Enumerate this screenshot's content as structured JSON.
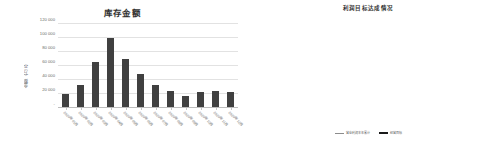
{
  "charts": [
    {
      "title": "库存金额",
      "ylabel": "金额（万元）"
    },
    {
      "title": "利润目标达成情况",
      "ylabel": "金额（元）"
    }
  ],
  "chart_data": [
    {
      "type": "bar",
      "title": "库存金额",
      "xlabel": "",
      "ylabel": "金额（万元）",
      "ylim": [
        0,
        120000
      ],
      "yticks": [
        0,
        20000,
        40000,
        60000,
        80000,
        100000,
        120000
      ],
      "ytick_labels": [
        "-",
        "20 000",
        "40 000",
        "60 000",
        "80 000",
        "100 000",
        "120 000"
      ],
      "grid": true,
      "legend": "none",
      "categories": [
        "2020年01月",
        "2020年02月",
        "2020年03月",
        "2020年04月",
        "2020年05月",
        "2020年06月",
        "2020年07月",
        "2020年08月",
        "2020年09月",
        "2020年10月",
        "2020年11月",
        "2020年12月"
      ],
      "values": [
        19000,
        31000,
        65000,
        98000,
        68000,
        47000,
        32000,
        23000,
        16000,
        21000,
        23000,
        22000
      ],
      "bar_color": "#404040"
    },
    {
      "type": "line",
      "title": "利润目标达成情况",
      "xlabel": "",
      "ylabel": "金额（元）",
      "ylim": [
        0,
        800000
      ],
      "yticks": [
        0,
        100000,
        200000,
        300000,
        400000,
        500000,
        600000,
        700000,
        800000
      ],
      "ytick_labels": [
        "-",
        "100 000",
        "200 000",
        "300 000",
        "400 000",
        "500 000",
        "600 000",
        "700 000",
        "800 000"
      ],
      "grid": true,
      "legend_position": "bottom",
      "x": [
        "2020年01月",
        "2020年02月",
        "2020年03月",
        "2020年04月",
        "2020年05月",
        "2020年06月",
        "2020年07月",
        "2020年08月",
        "2020年09月",
        "2020年10月",
        "2020年11月",
        "2020年12月"
      ],
      "series": [
        {
          "name": "营业利润本年累计",
          "color": "#8c8c8c",
          "width": 1,
          "values": [
            70000,
            120000,
            165000,
            205000,
            240000,
            255000,
            360000,
            430000,
            530000,
            640000,
            665000,
            700000
          ]
        },
        {
          "name": "经营目标",
          "color": "#1a1a1a",
          "width": 2,
          "values": [
            70000,
            110000,
            150000,
            190000,
            225000,
            260000,
            295000,
            330000,
            365000,
            400000,
            430000,
            455000
          ]
        }
      ]
    }
  ]
}
